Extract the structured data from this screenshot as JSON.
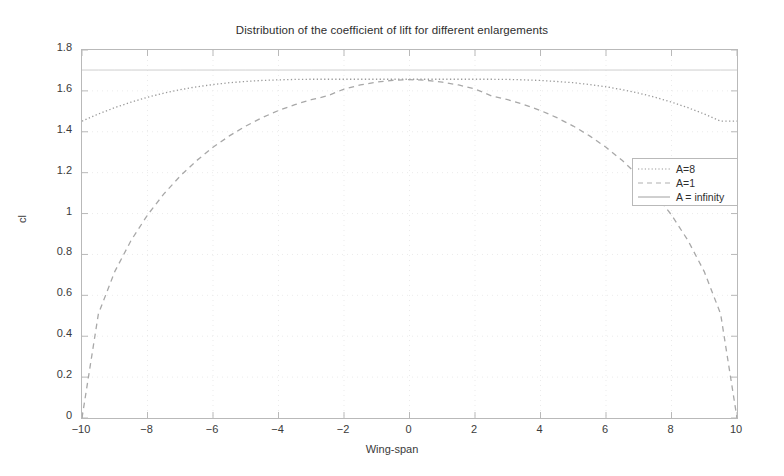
{
  "chart_data": {
    "type": "line",
    "title": "Distribution of the coefficient of lift for different enlargements",
    "xlabel": "Wing-span",
    "ylabel": "cl",
    "xlim": [
      -10,
      10
    ],
    "ylim": [
      0,
      1.8
    ],
    "xticks": [
      "-10",
      "-8",
      "-6",
      "-4",
      "-2",
      "0",
      "2",
      "4",
      "6",
      "8",
      "10"
    ],
    "xtick_values": [
      -10,
      -8,
      -6,
      -4,
      -2,
      0,
      2,
      4,
      6,
      8,
      10
    ],
    "yticks": [
      "0",
      "0.2",
      "0.4",
      "0.6",
      "0.8",
      "1",
      "1.2",
      "1.4",
      "1.6",
      "1.8"
    ],
    "ytick_values": [
      0,
      0.2,
      0.4,
      0.6,
      0.8,
      1.0,
      1.2,
      1.4,
      1.6,
      1.8
    ],
    "grid": true,
    "legend_position": "upper-right-inside",
    "x": [
      -10,
      -9.5,
      -9,
      -8.5,
      -8,
      -7.5,
      -7,
      -6.5,
      -6,
      -5.5,
      -5,
      -4.5,
      -4,
      -3.5,
      -3,
      -2.5,
      -2,
      -1.5,
      -1,
      -0.5,
      0,
      0.5,
      1,
      1.5,
      2,
      2.5,
      3,
      3.5,
      4,
      4.5,
      5,
      5.5,
      6,
      6.5,
      7,
      7.5,
      8,
      8.5,
      9,
      9.5,
      10
    ],
    "series": [
      {
        "name": "A=8",
        "style": "dotted",
        "color": "#9a9a9a",
        "values": [
          1.452,
          1.487,
          1.518,
          1.545,
          1.569,
          1.589,
          1.606,
          1.62,
          1.631,
          1.64,
          1.646,
          1.651,
          1.654,
          1.656,
          1.657,
          1.657,
          1.657,
          1.657,
          1.657,
          1.657,
          1.657,
          1.657,
          1.657,
          1.657,
          1.657,
          1.657,
          1.656,
          1.654,
          1.651,
          1.646,
          1.64,
          1.631,
          1.62,
          1.606,
          1.589,
          1.569,
          1.545,
          1.518,
          1.487,
          1.452,
          1.452
        ]
      },
      {
        "name": "A=1",
        "style": "dashed",
        "color": "#a8a8a8",
        "values": [
          0.0,
          0.509,
          0.716,
          0.869,
          0.993,
          1.096,
          1.184,
          1.259,
          1.324,
          1.38,
          1.428,
          1.469,
          1.504,
          1.533,
          1.557,
          1.576,
          1.609,
          1.629,
          1.643,
          1.652,
          1.655,
          1.652,
          1.643,
          1.629,
          1.609,
          1.576,
          1.557,
          1.533,
          1.504,
          1.469,
          1.428,
          1.38,
          1.324,
          1.259,
          1.184,
          1.096,
          0.993,
          0.869,
          0.716,
          0.509,
          0.0
        ]
      },
      {
        "name": "A = infinity",
        "style": "solid",
        "color": "#c8c8c8",
        "constant": 1.702,
        "values": [
          1.702,
          1.702,
          1.702,
          1.702,
          1.702,
          1.702,
          1.702,
          1.702,
          1.702,
          1.702,
          1.702,
          1.702,
          1.702,
          1.702,
          1.702,
          1.702,
          1.702,
          1.702,
          1.702,
          1.702,
          1.702,
          1.702,
          1.702,
          1.702,
          1.702,
          1.702,
          1.702,
          1.702,
          1.702,
          1.702,
          1.702,
          1.702,
          1.702,
          1.702,
          1.702,
          1.702,
          1.702,
          1.702,
          1.702,
          1.702,
          1.702
        ]
      }
    ]
  },
  "legend": {
    "items": [
      {
        "label": "A=8"
      },
      {
        "label": "A=1"
      },
      {
        "label": "A = infinity"
      }
    ]
  },
  "colors": {
    "axis": "#b9b9b9",
    "grid": "#e6e6e6",
    "text": "#3a3a3a",
    "background": "#ffffff"
  }
}
